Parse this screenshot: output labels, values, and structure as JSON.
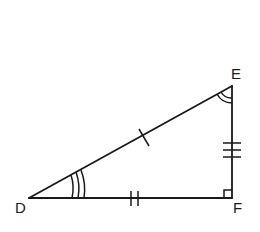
{
  "diagram": {
    "type": "right-triangle",
    "vertices": [
      {
        "label": "D",
        "x": 29,
        "y": 198
      },
      {
        "label": "E",
        "x": 232,
        "y": 86
      },
      {
        "label": "F",
        "x": 232,
        "y": 198
      }
    ],
    "sides": [
      {
        "name": "DE",
        "tick_marks": 1
      },
      {
        "name": "DF",
        "tick_marks": 2
      },
      {
        "name": "EF",
        "tick_marks": 3
      }
    ],
    "angles": [
      {
        "vertex": "D",
        "arc_marks": 3
      },
      {
        "vertex": "E",
        "arc_marks": 2
      },
      {
        "vertex": "F",
        "right_angle": true
      }
    ],
    "stroke_color": "#1a1a1a",
    "background": "#ffffff"
  }
}
